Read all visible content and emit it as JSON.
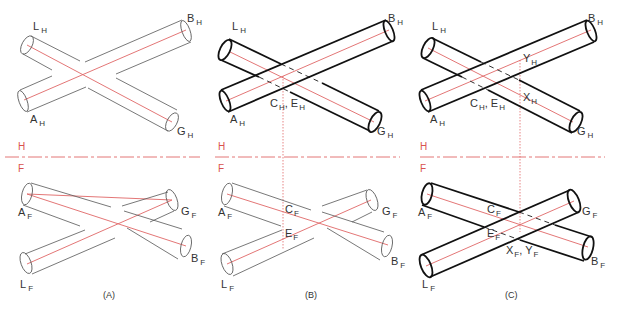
{
  "figure": {
    "panels": [
      {
        "id": "A",
        "caption": "(A)",
        "top_view_labels": {
          "L": "L",
          "B": "B",
          "A": "A",
          "G": "G"
        },
        "front_view_labels": {
          "A": "A",
          "G": "G",
          "L": "L",
          "B": "B"
        }
      },
      {
        "id": "B",
        "caption": "(B)",
        "top_view_labels": {
          "L": "L",
          "B": "B",
          "A": "A",
          "G": "G",
          "CE": "C",
          "CE2": "E"
        },
        "front_view_labels": {
          "A": "A",
          "C": "C",
          "E": "E",
          "G": "G",
          "L": "L",
          "B": "B"
        }
      },
      {
        "id": "C",
        "caption": "(C)",
        "top_view_labels": {
          "L": "L",
          "B": "B",
          "A": "A",
          "G": "G",
          "C": "C",
          "E": "E",
          "Y": "Y",
          "X": "X"
        },
        "front_view_labels": {
          "A": "A",
          "C": "C",
          "E": "E",
          "G": "G",
          "L": "L",
          "B": "B",
          "X": "X",
          "Y": "Y"
        }
      }
    ],
    "subscripts": {
      "horizontal": "H",
      "frontal": "F"
    },
    "fold_line_labels": {
      "top": "H",
      "bottom": "F"
    },
    "colors": {
      "centerline": "#e06666",
      "outline": "#111111",
      "fold_line": "#e06666"
    }
  }
}
